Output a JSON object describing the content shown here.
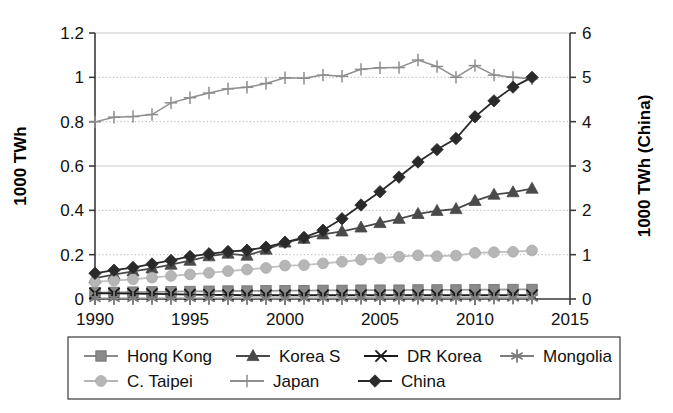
{
  "chart_data": {
    "type": "line",
    "title": "",
    "xlabel": "",
    "ylabel": "1000 TWh",
    "y2label": "1000 TWh (China)",
    "grid": true,
    "legend_position": "bottom",
    "x": [
      1990,
      1991,
      1992,
      1993,
      1994,
      1995,
      1996,
      1997,
      1998,
      1999,
      2000,
      2001,
      2002,
      2003,
      2004,
      2005,
      2006,
      2007,
      2008,
      2009,
      2010,
      2011,
      2012,
      2013
    ],
    "xlim": [
      1990,
      2015
    ],
    "xticks": [
      1990,
      1995,
      2000,
      2005,
      2010,
      2015
    ],
    "ylim": [
      0,
      1.2
    ],
    "yticks": [
      0,
      0.2,
      0.4,
      0.6,
      0.8,
      1,
      1.2
    ],
    "ytick_labels": [
      "0",
      "0.2",
      "0.4",
      "0.6",
      "0.8",
      "1",
      "1.2"
    ],
    "y2lim": [
      0,
      6
    ],
    "y2ticks": [
      0,
      1,
      2,
      3,
      4,
      5,
      6
    ],
    "y2tick_labels": [
      "0",
      "1",
      "2",
      "3",
      "4",
      "5",
      "6"
    ],
    "series": [
      {
        "name": "Hong Kong",
        "marker": "square",
        "color": "#8a8a8a",
        "line_color": "#9a9a9a",
        "axis": "left",
        "values": [
          0.029,
          0.03,
          0.031,
          0.032,
          0.033,
          0.034,
          0.035,
          0.036,
          0.036,
          0.037,
          0.038,
          0.038,
          0.039,
          0.039,
          0.04,
          0.04,
          0.04,
          0.041,
          0.041,
          0.041,
          0.042,
          0.042,
          0.043,
          0.043
        ]
      },
      {
        "name": "Korea S",
        "marker": "triangle",
        "color": "#4a4a4a",
        "line_color": "#4a4a4a",
        "axis": "left",
        "values": [
          0.094,
          0.11,
          0.125,
          0.138,
          0.155,
          0.173,
          0.193,
          0.205,
          0.196,
          0.223,
          0.255,
          0.272,
          0.292,
          0.305,
          0.323,
          0.343,
          0.362,
          0.384,
          0.398,
          0.406,
          0.443,
          0.471,
          0.482,
          0.498
        ]
      },
      {
        "name": "DR Korea",
        "marker": "x",
        "color": "#1a1a1a",
        "line_color": "#1a1a1a",
        "axis": "left",
        "values": [
          0.026,
          0.025,
          0.024,
          0.023,
          0.022,
          0.02,
          0.019,
          0.018,
          0.017,
          0.017,
          0.017,
          0.017,
          0.017,
          0.017,
          0.017,
          0.017,
          0.017,
          0.017,
          0.017,
          0.017,
          0.017,
          0.017,
          0.017,
          0.017
        ]
      },
      {
        "name": "Mongolia",
        "marker": "asterisk",
        "color": "#7d7d7d",
        "line_color": "#8d8d8d",
        "axis": "left",
        "values": [
          0.003,
          0.003,
          0.003,
          0.003,
          0.003,
          0.003,
          0.003,
          0.003,
          0.003,
          0.003,
          0.003,
          0.003,
          0.003,
          0.003,
          0.004,
          0.004,
          0.004,
          0.004,
          0.004,
          0.004,
          0.005,
          0.005,
          0.005,
          0.005
        ]
      },
      {
        "name": "C. Taipei",
        "marker": "circle",
        "color": "#b6b6b6",
        "line_color": "#c0c0c0",
        "axis": "left",
        "values": [
          0.077,
          0.083,
          0.089,
          0.096,
          0.104,
          0.111,
          0.118,
          0.126,
          0.133,
          0.14,
          0.151,
          0.153,
          0.161,
          0.168,
          0.177,
          0.184,
          0.191,
          0.197,
          0.193,
          0.196,
          0.208,
          0.211,
          0.213,
          0.219
        ]
      },
      {
        "name": "Japan",
        "marker": "plus",
        "color": "#8e8e8e",
        "line_color": "#8e8e8e",
        "axis": "left",
        "values": [
          0.799,
          0.82,
          0.823,
          0.832,
          0.885,
          0.908,
          0.929,
          0.948,
          0.955,
          0.972,
          0.998,
          0.996,
          1.01,
          1.005,
          1.036,
          1.043,
          1.044,
          1.078,
          1.049,
          1.0,
          1.053,
          1.01,
          1.0,
          0.993
        ]
      },
      {
        "name": "China",
        "marker": "diamond",
        "color": "#2a2a2a",
        "line_color": "#2a2a2a",
        "axis": "right",
        "values_right": [
          0.58,
          0.65,
          0.71,
          0.79,
          0.87,
          0.96,
          1.02,
          1.07,
          1.1,
          1.17,
          1.28,
          1.39,
          1.55,
          1.81,
          2.12,
          2.42,
          2.75,
          3.09,
          3.37,
          3.62,
          4.11,
          4.47,
          4.78,
          5.0
        ]
      }
    ]
  },
  "legend": {
    "row1": [
      {
        "label": "Hong Kong",
        "marker": "square",
        "color": "#8a8a8a"
      },
      {
        "label": "Korea S",
        "marker": "triangle",
        "color": "#4a4a4a"
      },
      {
        "label": "DR Korea",
        "marker": "x",
        "color": "#1a1a1a"
      },
      {
        "label": "Mongolia",
        "marker": "asterisk",
        "color": "#7d7d7d"
      }
    ],
    "row2": [
      {
        "label": "C. Taipei",
        "marker": "circle",
        "color": "#b6b6b6"
      },
      {
        "label": "Japan",
        "marker": "plus",
        "color": "#8e8e8e"
      },
      {
        "label": "China",
        "marker": "diamond",
        "color": "#2a2a2a"
      }
    ]
  }
}
